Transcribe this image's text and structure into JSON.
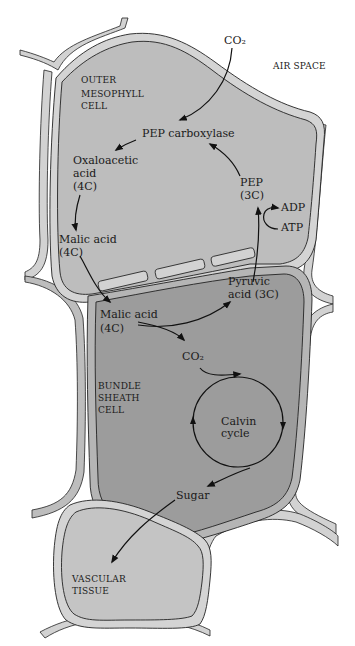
{
  "diagram": {
    "colors": {
      "mesophyll_fill": "#bdbdbd",
      "bundle_sheath_fill": "#9c9c9c",
      "vascular_fill": "#c4c4c4",
      "cell_wall": "#d4d4d4",
      "air_space": "#ffffff",
      "arrow": "#111111"
    },
    "regions": {
      "air_space": "AIR SPACE",
      "outer_mesophyll": [
        "OUTER",
        "MESOPHYLL",
        "CELL"
      ],
      "bundle_sheath": [
        "BUNDLE",
        "SHEATH",
        "CELL"
      ],
      "vascular_tissue": [
        "VASCULAR",
        "TISSUE"
      ]
    },
    "nodes": {
      "co2_in": "CO₂",
      "pep_carboxylase": "PEP carboxylase",
      "oxaloacetic": [
        "Oxaloacetic",
        "acid",
        "(4C)"
      ],
      "malic_meso": [
        "Malic acid",
        "(4C)"
      ],
      "pep": [
        "PEP",
        "(3C)"
      ],
      "adp": "ADP",
      "atp": "ATP",
      "malic_bundle": [
        "Malic acid",
        "(4C)"
      ],
      "pyruvic": [
        "Pyruvic",
        "acid (3C)"
      ],
      "co2_bundle": "CO₂",
      "calvin": [
        "Calvin",
        "cycle"
      ],
      "sugar": "Sugar"
    },
    "flows": [
      {
        "from": "co2_in",
        "to": "pep_carboxylase"
      },
      {
        "from": "pep_carboxylase",
        "to": "oxaloacetic"
      },
      {
        "from": "oxaloacetic",
        "to": "malic_meso"
      },
      {
        "from": "malic_meso",
        "to": "malic_bundle"
      },
      {
        "from": "malic_bundle",
        "to": "pyruvic"
      },
      {
        "from": "malic_bundle",
        "to": "co2_bundle"
      },
      {
        "from": "co2_bundle",
        "to": "calvin"
      },
      {
        "from": "pyruvic",
        "to": "pep"
      },
      {
        "from": "atp",
        "to": "adp"
      },
      {
        "from": "pep",
        "to": "pep_carboxylase"
      },
      {
        "from": "calvin",
        "to": "sugar"
      },
      {
        "from": "sugar",
        "to": "vascular_tissue"
      }
    ]
  }
}
